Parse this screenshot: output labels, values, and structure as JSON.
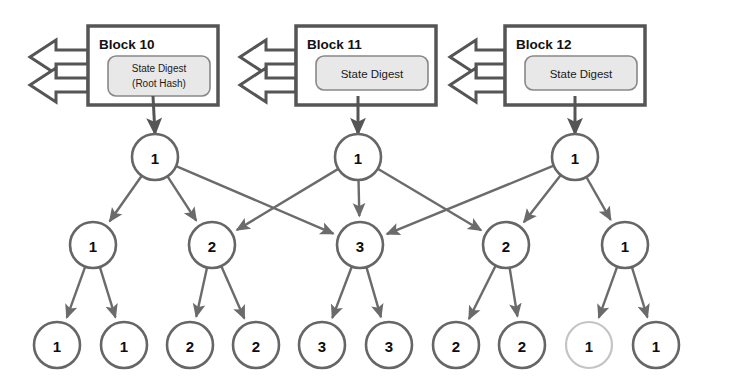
{
  "diagram": {
    "background": "#ffffff",
    "colors": {
      "block_border": "#555555",
      "block_fill": "#ffffff",
      "digest_fill": "#e8e8e8",
      "digest_border": "#888888",
      "node_stroke": "#666666",
      "node_stroke_faded": "#c4c4c4",
      "edge": "#6b6b6b",
      "arrow_outline": "#555555",
      "text": "#111111"
    },
    "blocks": [
      {
        "id": "block-10",
        "title": "Block 10",
        "digest_line1": "State Digest",
        "digest_line2": "(Root Hash)",
        "two_line": true,
        "x": 88,
        "y": 26,
        "w": 130,
        "h": 79
      },
      {
        "id": "block-11",
        "title": "Block 11",
        "digest_line1": "State Digest",
        "digest_line2": "",
        "two_line": false,
        "x": 296,
        "y": 26,
        "w": 140,
        "h": 79
      },
      {
        "id": "block-12",
        "title": "Block 12",
        "digest_line1": "State Digest",
        "digest_line2": "",
        "two_line": false,
        "x": 505,
        "y": 26,
        "w": 140,
        "h": 79
      }
    ],
    "prev_arrows": [
      {
        "id": "prev-arrow-block-10",
        "tip_x": 30,
        "attach_x": 88,
        "y": 57
      },
      {
        "id": "prev-arrow-block-10-b",
        "tip_x": 30,
        "attach_x": 88,
        "y": 85
      },
      {
        "id": "prev-arrow-block-11",
        "tip_x": 240,
        "attach_x": 296,
        "y": 57
      },
      {
        "id": "prev-arrow-block-11-b",
        "tip_x": 240,
        "attach_x": 296,
        "y": 85
      },
      {
        "id": "prev-arrow-block-12",
        "tip_x": 450,
        "attach_x": 505,
        "y": 57
      },
      {
        "id": "prev-arrow-block-12-b",
        "tip_x": 450,
        "attach_x": 505,
        "y": 85
      }
    ],
    "roots": [
      {
        "id": "root-0",
        "label": "1",
        "cx": 155,
        "cy": 157,
        "r": 23,
        "faded": false
      },
      {
        "id": "root-1",
        "label": "1",
        "cx": 358,
        "cy": 157,
        "r": 23,
        "faded": false
      },
      {
        "id": "root-2",
        "label": "1",
        "cx": 575,
        "cy": 157,
        "r": 23,
        "faded": false
      }
    ],
    "middle": [
      {
        "id": "mid-0",
        "label": "1",
        "cx": 93,
        "cy": 245,
        "r": 23,
        "faded": false
      },
      {
        "id": "mid-1",
        "label": "2",
        "cx": 212,
        "cy": 245,
        "r": 23,
        "faded": false
      },
      {
        "id": "mid-2",
        "label": "3",
        "cx": 360,
        "cy": 245,
        "r": 23,
        "faded": false
      },
      {
        "id": "mid-3",
        "label": "2",
        "cx": 506,
        "cy": 245,
        "r": 23,
        "faded": false
      },
      {
        "id": "mid-4",
        "label": "1",
        "cx": 625,
        "cy": 245,
        "r": 23,
        "faded": false
      }
    ],
    "leaves": [
      {
        "id": "leaf-0",
        "label": "1",
        "cx": 57,
        "cy": 345,
        "r": 23,
        "faded": false
      },
      {
        "id": "leaf-1",
        "label": "1",
        "cx": 124,
        "cy": 345,
        "r": 23,
        "faded": false
      },
      {
        "id": "leaf-2",
        "label": "2",
        "cx": 190,
        "cy": 345,
        "r": 23,
        "faded": false
      },
      {
        "id": "leaf-3",
        "label": "2",
        "cx": 256,
        "cy": 345,
        "r": 23,
        "faded": false
      },
      {
        "id": "leaf-4",
        "label": "3",
        "cx": 322,
        "cy": 345,
        "r": 23,
        "faded": false
      },
      {
        "id": "leaf-5",
        "label": "3",
        "cx": 389,
        "cy": 345,
        "r": 23,
        "faded": false
      },
      {
        "id": "leaf-6",
        "label": "2",
        "cx": 456,
        "cy": 345,
        "r": 23,
        "faded": false
      },
      {
        "id": "leaf-7",
        "label": "2",
        "cx": 522,
        "cy": 345,
        "r": 23,
        "faded": false
      },
      {
        "id": "leaf-8",
        "label": "1",
        "cx": 589,
        "cy": 345,
        "r": 23,
        "faded": true
      },
      {
        "id": "leaf-9",
        "label": "1",
        "cx": 656,
        "cy": 345,
        "r": 23,
        "faded": false
      }
    ],
    "digest_to_root_edges": [
      {
        "id": "digest-edge-0",
        "from_x": 153,
        "from_y": 96,
        "to_x": 155,
        "to_y": 134
      },
      {
        "id": "digest-edge-1",
        "from_x": 358,
        "from_y": 96,
        "to_x": 358,
        "to_y": 134
      },
      {
        "id": "digest-edge-2",
        "from_x": 575,
        "from_y": 96,
        "to_x": 575,
        "to_y": 134
      }
    ],
    "root_to_middle_edges": [
      {
        "id": "edge-root0-mid0",
        "from": "root-0",
        "to": "mid-0"
      },
      {
        "id": "edge-root0-mid1",
        "from": "root-0",
        "to": "mid-1"
      },
      {
        "id": "edge-root0-mid2",
        "from": "root-0",
        "to": "mid-2"
      },
      {
        "id": "edge-root1-mid1",
        "from": "root-1",
        "to": "mid-1"
      },
      {
        "id": "edge-root1-mid2",
        "from": "root-1",
        "to": "mid-2"
      },
      {
        "id": "edge-root1-mid3",
        "from": "root-1",
        "to": "mid-3"
      },
      {
        "id": "edge-root2-mid2",
        "from": "root-2",
        "to": "mid-2"
      },
      {
        "id": "edge-root2-mid3",
        "from": "root-2",
        "to": "mid-3"
      },
      {
        "id": "edge-root2-mid4",
        "from": "root-2",
        "to": "mid-4"
      }
    ],
    "middle_to_leaf_edges": [
      {
        "id": "edge-mid0-leaf0",
        "from": "mid-0",
        "to": "leaf-0"
      },
      {
        "id": "edge-mid0-leaf1",
        "from": "mid-0",
        "to": "leaf-1"
      },
      {
        "id": "edge-mid1-leaf2",
        "from": "mid-1",
        "to": "leaf-2"
      },
      {
        "id": "edge-mid1-leaf3",
        "from": "mid-1",
        "to": "leaf-3"
      },
      {
        "id": "edge-mid2-leaf4",
        "from": "mid-2",
        "to": "leaf-4"
      },
      {
        "id": "edge-mid2-leaf5",
        "from": "mid-2",
        "to": "leaf-5"
      },
      {
        "id": "edge-mid3-leaf6",
        "from": "mid-3",
        "to": "leaf-6"
      },
      {
        "id": "edge-mid3-leaf7",
        "from": "mid-3",
        "to": "leaf-7"
      },
      {
        "id": "edge-mid4-leaf8",
        "from": "mid-4",
        "to": "leaf-8"
      },
      {
        "id": "edge-mid4-leaf9",
        "from": "mid-4",
        "to": "leaf-9"
      }
    ]
  }
}
